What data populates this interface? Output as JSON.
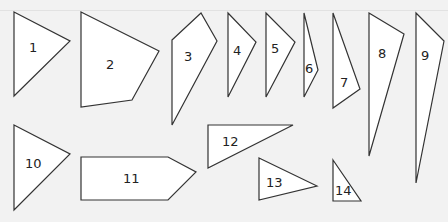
{
  "diagram": {
    "background": "#f2f2f2",
    "fill": "#ffffff",
    "stroke": "#333333",
    "shapes": [
      {
        "id": 1,
        "label": "1",
        "points": "14,12 70,41 14,96",
        "lx": 29,
        "ly": 52
      },
      {
        "id": 2,
        "label": "2",
        "points": "81,12 159,51 132,100 81,107",
        "lx": 106,
        "ly": 69
      },
      {
        "id": 3,
        "label": "3",
        "points": "172,40 201,13 217,41 172,125",
        "lx": 184,
        "ly": 61
      },
      {
        "id": 4,
        "label": "4",
        "points": "228,13 256,42 228,97",
        "lx": 233,
        "ly": 55
      },
      {
        "id": 5,
        "label": "5",
        "points": "266,13 295,42 266,97",
        "lx": 271,
        "ly": 53
      },
      {
        "id": 6,
        "label": "6",
        "points": "304,13 318,70 304,97",
        "lx": 305,
        "ly": 73
      },
      {
        "id": 7,
        "label": "7",
        "points": "333,13 360,89 333,108",
        "lx": 340,
        "ly": 87
      },
      {
        "id": 8,
        "label": "8",
        "points": "369,13 404,34 369,156",
        "lx": 378,
        "ly": 58
      },
      {
        "id": 9,
        "label": "9",
        "points": "416,13 444,41 416,183",
        "lx": 421,
        "ly": 60
      },
      {
        "id": 10,
        "label": "10",
        "points": "14,125 70,154 14,210",
        "lx": 25,
        "ly": 168
      },
      {
        "id": 11,
        "label": "11",
        "points": "81,157 168,157 196,172 168,200 81,200",
        "lx": 123,
        "ly": 183
      },
      {
        "id": 12,
        "label": "12",
        "points": "208,125 293,125 208,168",
        "lx": 222,
        "ly": 146
      },
      {
        "id": 13,
        "label": "13",
        "points": "259,158 317,186 259,200",
        "lx": 266,
        "ly": 187
      },
      {
        "id": 14,
        "label": "14",
        "points": "333,160 361,201 333,201",
        "lx": 335,
        "ly": 195
      }
    ]
  }
}
